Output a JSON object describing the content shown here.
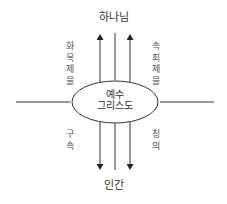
{
  "diagram": {
    "top_node": "하나님",
    "bottom_node": "인간",
    "center_node": {
      "line1": "예수",
      "line2": "그리스도"
    },
    "upward_labels": {
      "left": "화목제물",
      "right": "속죄제물"
    },
    "downward_labels": {
      "left": "구속",
      "right": "칭의"
    },
    "colors": {
      "line": "#333333",
      "text": "#444444",
      "background": "#ffffff"
    }
  }
}
